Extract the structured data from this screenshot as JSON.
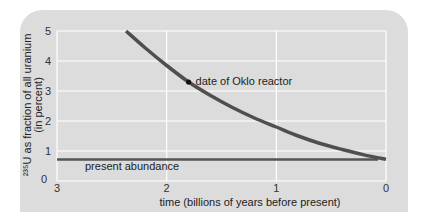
{
  "chart_data": {
    "type": "line",
    "title": "",
    "xlabel": "time (billions of years before present)",
    "ylabel_line1": "²³⁵U as fraction of all uranium",
    "ylabel_line2": "(in percent)",
    "xlim": [
      3,
      0
    ],
    "ylim": [
      0,
      5
    ],
    "x_ticks": [
      3,
      2,
      1,
      0
    ],
    "y_ticks": [
      0,
      1,
      2,
      3,
      4,
      5
    ],
    "x_tick_labels": [
      "3",
      "2",
      "1",
      "0"
    ],
    "y_tick_labels": [
      "0",
      "1",
      "2",
      "3",
      "4",
      "5"
    ],
    "grid": true,
    "series": [
      {
        "name": "235U fraction",
        "x": [
          2.37,
          2.2,
          2.0,
          1.8,
          1.6,
          1.4,
          1.2,
          1.0,
          0.8,
          0.6,
          0.4,
          0.2,
          0.0
        ],
        "y": [
          5.0,
          4.45,
          3.85,
          3.3,
          2.85,
          2.45,
          2.1,
          1.8,
          1.5,
          1.25,
          1.05,
          0.87,
          0.72
        ]
      }
    ],
    "reference_line": {
      "label": "present abundance",
      "y": 0.72
    },
    "annotations": [
      {
        "label": "date of Oklo reactor",
        "x": 1.8,
        "y": 3.3
      }
    ]
  },
  "colors": {
    "panel": "#dcdcdc",
    "grid": "#ffffff",
    "curve": "#4f4f4f",
    "text": "#222222"
  }
}
